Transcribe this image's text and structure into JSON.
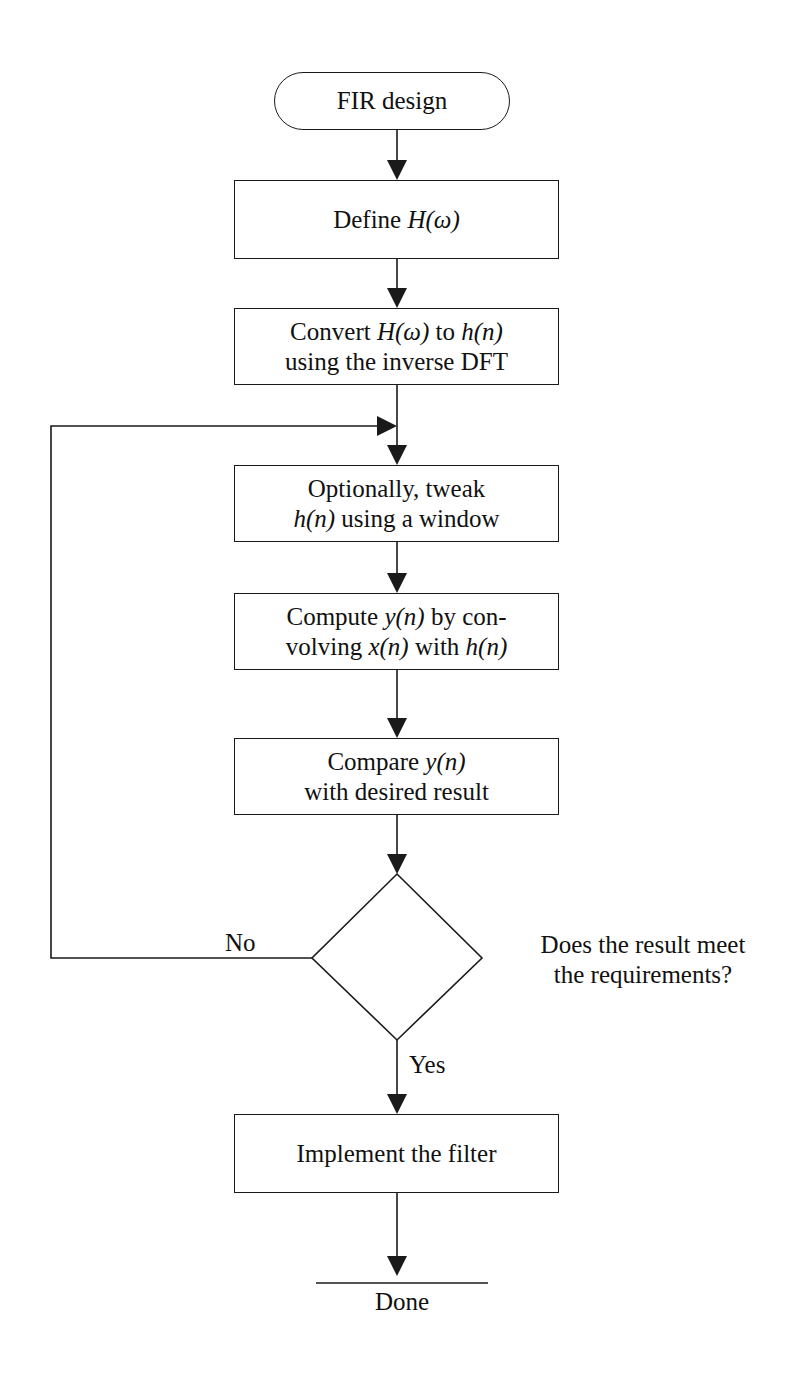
{
  "title": "FIR design",
  "nodes": {
    "start": "FIR design",
    "define": {
      "pre": "Define ",
      "math": "H(ω)"
    },
    "convert": {
      "l1_pre": "Convert ",
      "l1_m1": "H(ω)",
      "l1_mid": " to ",
      "l1_m2": "h(n)",
      "l2": "using the inverse DFT"
    },
    "window": {
      "l1": "Optionally, tweak",
      "l2_m": "h(n)",
      "l2_post": " using a window"
    },
    "compute": {
      "l1_pre": "Compute ",
      "l1_m": "y(n)",
      "l1_post": " by con-",
      "l2_pre": "volving ",
      "l2_m1": "x(n)",
      "l2_mid": " with ",
      "l2_m2": "h(n)"
    },
    "compare": {
      "l1_pre": "Compare ",
      "l1_m": "y(n)",
      "l2": "with desired result"
    },
    "decision": {
      "l1": "Does the result meet",
      "l2": "the requirements?"
    },
    "implement": "Implement the filter",
    "end": "Done"
  },
  "edges": {
    "no_label": "No",
    "yes_label": "Yes"
  },
  "colors": {
    "line": "#1a1a1a",
    "background": "#ffffff"
  }
}
